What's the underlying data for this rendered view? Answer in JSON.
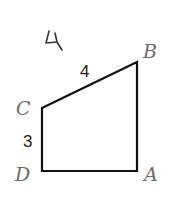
{
  "problem": {
    "number": "4",
    "number_style": "handwritten"
  },
  "figure": {
    "shape": "quadrilateral (right trapezoid)",
    "vertices": [
      {
        "name": "A",
        "x": 137,
        "y": 171
      },
      {
        "name": "B",
        "x": 137,
        "y": 62
      },
      {
        "name": "C",
        "x": 42,
        "y": 108
      },
      {
        "name": "D",
        "x": 42,
        "y": 171
      }
    ],
    "labels": {
      "A": "A",
      "B": "B",
      "C": "C",
      "D": "D"
    },
    "side_lengths": {
      "CB": "4",
      "CD": "3"
    },
    "stroke_color": "#111111",
    "label_color": "#6b6b6b"
  }
}
